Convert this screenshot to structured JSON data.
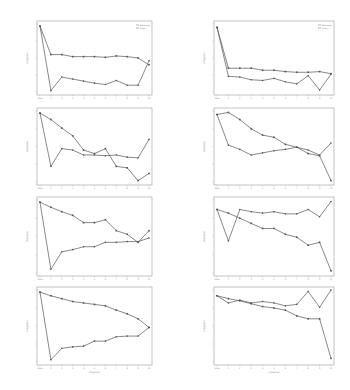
{
  "chart_data": {
    "type": "line",
    "layout": {
      "rows": 4,
      "cols": 2,
      "grid": false,
      "legend_position": "upper right (first row only)"
    },
    "x_categories": [
      "base",
      "1",
      "2",
      "3",
      "4",
      "5",
      "6",
      "7",
      "8",
      "9",
      "10"
    ],
    "legend": [
      "Reference",
      "Query"
    ],
    "note": "Axis tick labels and titles are illegible at this resolution; values are normalized (0 = bottom of plot area, 1 = top) estimates read from line positions.",
    "panels": [
      {
        "id": "r1c1",
        "xlabel": "",
        "ylabel": "(illegible)",
        "series": [
          {
            "name": "Reference",
            "values": [
              0.97,
              0.55,
              0.55,
              0.52,
              0.52,
              0.52,
              0.51,
              0.53,
              0.52,
              0.5,
              0.4
            ]
          },
          {
            "name": "Query",
            "values": [
              0.97,
              0.02,
              0.22,
              0.19,
              0.16,
              0.13,
              0.11,
              0.17,
              0.1,
              0.1,
              0.46
            ]
          }
        ]
      },
      {
        "id": "r1c2",
        "xlabel": "",
        "ylabel": "(illegible)",
        "series": [
          {
            "name": "Reference",
            "values": [
              0.95,
              0.35,
              0.35,
              0.35,
              0.32,
              0.32,
              0.3,
              0.29,
              0.29,
              0.3,
              0.27
            ]
          },
          {
            "name": "Query",
            "values": [
              0.95,
              0.23,
              0.22,
              0.18,
              0.17,
              0.2,
              0.15,
              0.12,
              0.24,
              0.03,
              0.26
            ]
          }
        ]
      },
      {
        "id": "r2c1",
        "xlabel": "",
        "ylabel": "(illegible)",
        "series": [
          {
            "name": "Reference",
            "values": [
              0.97,
              0.88,
              0.76,
              0.65,
              0.45,
              0.4,
              0.47,
              0.22,
              0.2,
              0.02,
              0.12
            ]
          },
          {
            "name": "Query",
            "values": [
              0.97,
              0.22,
              0.47,
              0.45,
              0.38,
              0.38,
              0.37,
              0.38,
              0.35,
              0.34,
              0.6
            ]
          }
        ]
      },
      {
        "id": "r2c2",
        "xlabel": "",
        "ylabel": "(illegible)",
        "series": [
          {
            "name": "Reference",
            "values": [
              0.95,
              0.98,
              0.88,
              0.75,
              0.66,
              0.63,
              0.53,
              0.49,
              0.4,
              0.37,
              0.02
            ]
          },
          {
            "name": "Query",
            "values": [
              0.95,
              0.52,
              0.46,
              0.38,
              0.41,
              0.44,
              0.46,
              0.49,
              0.45,
              0.38,
              0.55
            ]
          }
        ]
      },
      {
        "id": "r3c1",
        "xlabel": "",
        "ylabel": "(illegible)",
        "series": [
          {
            "name": "Reference",
            "values": [
              0.97,
              0.9,
              0.84,
              0.79,
              0.69,
              0.69,
              0.73,
              0.58,
              0.53,
              0.42,
              0.58
            ]
          },
          {
            "name": "Query",
            "values": [
              0.97,
              0.05,
              0.29,
              0.32,
              0.36,
              0.36,
              0.42,
              0.42,
              0.43,
              0.43,
              0.48
            ]
          }
        ]
      },
      {
        "id": "r3c2",
        "xlabel": "",
        "ylabel": "(illegible)",
        "series": [
          {
            "name": "Reference",
            "values": [
              0.87,
              0.82,
              0.75,
              0.68,
              0.61,
              0.61,
              0.53,
              0.49,
              0.38,
              0.42,
              0.03
            ]
          },
          {
            "name": "Query",
            "values": [
              0.87,
              0.44,
              0.87,
              0.84,
              0.82,
              0.84,
              0.81,
              0.81,
              0.87,
              0.77,
              0.98
            ]
          }
        ]
      },
      {
        "id": "r4c1",
        "xlabel": "(illegible)",
        "ylabel": "(illegible)",
        "series": [
          {
            "name": "Reference",
            "values": [
              0.97,
              0.92,
              0.88,
              0.84,
              0.82,
              0.8,
              0.78,
              0.72,
              0.67,
              0.6,
              0.48
            ]
          },
          {
            "name": "Query",
            "values": [
              0.97,
              0.03,
              0.19,
              0.21,
              0.22,
              0.29,
              0.29,
              0.35,
              0.36,
              0.36,
              0.48
            ]
          }
        ]
      },
      {
        "id": "r4c2",
        "xlabel": "(illegible)",
        "ylabel": "(illegible)",
        "series": [
          {
            "name": "Reference",
            "values": [
              0.92,
              0.88,
              0.85,
              0.81,
              0.77,
              0.75,
              0.72,
              0.64,
              0.6,
              0.6,
              0.05
            ]
          },
          {
            "name": "Query",
            "values": [
              0.92,
              0.82,
              0.86,
              0.82,
              0.84,
              0.82,
              0.78,
              0.8,
              0.98,
              0.76,
              1.0
            ]
          }
        ]
      }
    ]
  }
}
